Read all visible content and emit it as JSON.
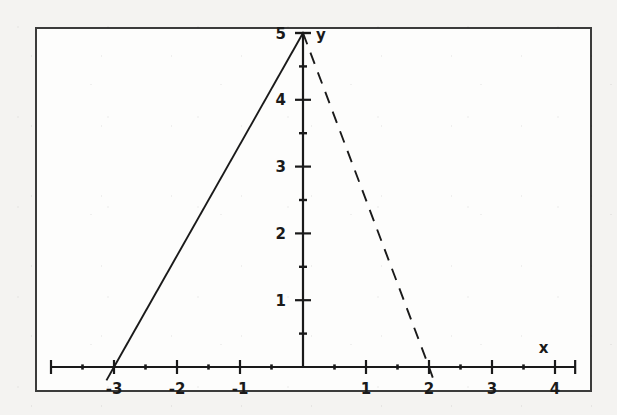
{
  "figure": {
    "background_color": "#f4f3f1",
    "panel_color": "#fdfdfc",
    "ink_color": "#1a1a1a",
    "border_color": "#3b3b3b",
    "x_axis_label": "x",
    "y_axis_label": "y"
  },
  "chart_data": {
    "type": "line",
    "title": "",
    "xlabel": "x",
    "ylabel": "y",
    "grid": false,
    "legend": "none",
    "xlim": [
      -3.5,
      4
    ],
    "ylim": [
      0,
      5.4
    ],
    "x_ticks": [
      -3,
      -2,
      -1,
      1,
      2,
      3,
      4
    ],
    "x_tick_labels": [
      "-3",
      "-2",
      "-1",
      "1",
      "2",
      "3",
      "4"
    ],
    "x_minor_ticks": [
      -3.5,
      -2.5,
      -1.5,
      -0.5,
      0.5,
      1.5,
      2.5,
      3.5
    ],
    "y_ticks": [
      1,
      2,
      3,
      4,
      5
    ],
    "y_tick_labels": [
      "1",
      "2",
      "3",
      "4",
      "5"
    ],
    "y_minor_ticks": [
      0.5,
      1.5,
      2.5,
      3.5,
      4.5
    ],
    "series": [
      {
        "name": "left-branch",
        "style": "solid",
        "points": [
          [
            -3,
            0
          ],
          [
            0,
            5
          ]
        ]
      },
      {
        "name": "right-branch",
        "style": "dashed",
        "points": [
          [
            0,
            5
          ],
          [
            2,
            0
          ]
        ]
      }
    ],
    "annotations": [
      {
        "name": "vertex",
        "x": 0,
        "y": 5,
        "marker": "tick"
      }
    ]
  }
}
